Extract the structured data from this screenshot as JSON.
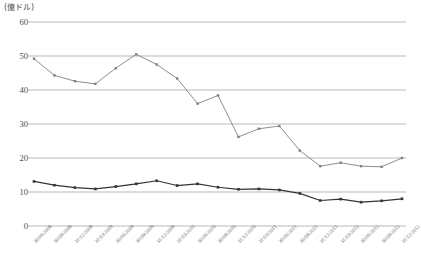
{
  "axis": {
    "unit_label": "(億ドル)",
    "y_ticks": [
      "60",
      "50",
      "40",
      "30",
      "20",
      "10",
      "0"
    ]
  },
  "chart_data": {
    "type": "line",
    "title": "",
    "xlabel": "",
    "ylabel": "(億ドル)",
    "ylim": [
      0,
      62
    ],
    "y_ticks": [
      0,
      10,
      20,
      30,
      40,
      50,
      60
    ],
    "grid": true,
    "legend": "none",
    "categories": [
      "30/06/2008",
      "30/09/2008",
      "31/12/2008",
      "31/03/2009",
      "30/06/2009",
      "30/09/2009",
      "31/12/2009",
      "31/03/2010",
      "30/06/2010",
      "30/09/2010",
      "31/12/2010",
      "31/03/2011",
      "30/06/2011",
      "30/09/2011",
      "31/12/2011",
      "31/03/2012",
      "30/06/2012",
      "30/09/2012",
      "31/12/2012"
    ],
    "series": [
      {
        "name": "series-upper",
        "color": "#808080",
        "values": [
          49.2,
          44.3,
          42.6,
          41.8,
          46.4,
          50.5,
          47.5,
          43.4,
          36.0,
          38.4,
          26.2,
          28.6,
          29.4,
          22.2,
          17.6,
          18.6,
          17.6,
          17.4,
          20.0
        ]
      },
      {
        "name": "series-lower",
        "color": "#333333",
        "values": [
          13.1,
          12.0,
          11.3,
          10.9,
          11.6,
          12.4,
          13.3,
          11.9,
          12.4,
          11.4,
          10.8,
          10.9,
          10.6,
          9.6,
          7.5,
          7.9,
          7.0,
          7.4,
          8.0
        ]
      }
    ]
  }
}
